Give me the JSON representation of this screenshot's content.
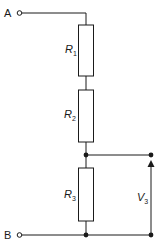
{
  "diagram": {
    "type": "potential-divider-circuit",
    "terminals": {
      "top": "A",
      "bottom": "B"
    },
    "resistors": [
      {
        "symbol": "R",
        "sub": "1"
      },
      {
        "symbol": "R",
        "sub": "2"
      },
      {
        "symbol": "R",
        "sub": "3"
      }
    ],
    "output_voltage": {
      "symbol": "V",
      "sub": "3"
    },
    "colors": {
      "line": "#1a1a1a",
      "background": "#ffffff"
    }
  }
}
